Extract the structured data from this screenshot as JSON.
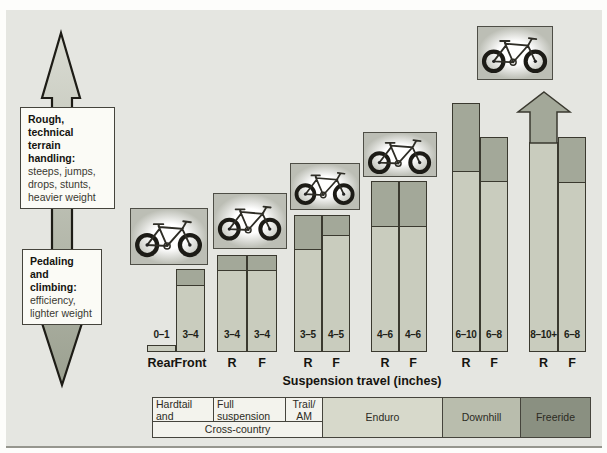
{
  "colors": {
    "panel_bg": "#e5e6e1",
    "bar_light": "#c9ccbe",
    "bar_dark": "#a3a899",
    "bar_border": "#3a392f",
    "arrow_gradient_top": "#dadcd3",
    "arrow_gradient_bottom": "#9ba090",
    "table_light": "#f3f3ed",
    "table_enduro": "#d7d9cb",
    "table_downhill": "#b9bdad",
    "table_freeride": "#8a9081"
  },
  "left_guide": {
    "top_box": {
      "title_lines": [
        "Rough, technical",
        "terrain handling:"
      ],
      "lines": [
        "steeps, jumps,",
        "drops, stunts,",
        "heavier weight"
      ]
    },
    "bottom_box": {
      "title_lines": [
        "Pedaling and",
        "climbing:"
      ],
      "lines": [
        "efficiency,",
        "lighter weight"
      ]
    }
  },
  "chart_data": {
    "type": "bar",
    "xlabel": "Suspension travel (inches)",
    "baseline_y": 352,
    "legend": "paired bars per bike class: R = rear travel, F = front travel; dark cap = travel range, open arrow = 10+ inches",
    "groups": [
      {
        "category": "Hardtail and softtail",
        "bike": {
          "icon": "hardtail-mountain-bike",
          "x": 130,
          "y": 208,
          "w": 78,
          "h": 57
        },
        "bars": [
          {
            "axis_label": "Rear",
            "travel": "0–1",
            "min": 0,
            "max": 1,
            "x": 147,
            "w": 29,
            "top": 345,
            "cap_bottom": 345
          },
          {
            "axis_label": "Front",
            "travel": "3–4",
            "min": 3,
            "max": 4,
            "x": 176,
            "w": 29,
            "top": 269,
            "cap_bottom": 285
          }
        ]
      },
      {
        "category": "Full suspension race",
        "bike": {
          "icon": "full-suspension-race-bike",
          "x": 213,
          "y": 193,
          "w": 74,
          "h": 56
        },
        "bars": [
          {
            "axis_label": "R",
            "travel": "3–4",
            "min": 3,
            "max": 4,
            "x": 217,
            "w": 30,
            "top": 255,
            "cap_bottom": 270
          },
          {
            "axis_label": "F",
            "travel": "3–4",
            "min": 3,
            "max": 4,
            "x": 247,
            "w": 30,
            "top": 255,
            "cap_bottom": 270
          }
        ]
      },
      {
        "category": "Trail/AM",
        "bike": {
          "icon": "trail-am-bike",
          "x": 290,
          "y": 163,
          "w": 70,
          "h": 47
        },
        "bars": [
          {
            "axis_label": "R",
            "travel": "3–5",
            "min": 3,
            "max": 5,
            "x": 294,
            "w": 28,
            "top": 215,
            "cap_bottom": 249
          },
          {
            "axis_label": "F",
            "travel": "4–5",
            "min": 4,
            "max": 5,
            "x": 322,
            "w": 28,
            "top": 215,
            "cap_bottom": 235
          }
        ]
      },
      {
        "category": "Enduro",
        "bike": {
          "icon": "enduro-bike",
          "x": 363,
          "y": 132,
          "w": 74,
          "h": 45
        },
        "bars": [
          {
            "axis_label": "R",
            "travel": "4–6",
            "min": 4,
            "max": 6,
            "x": 371,
            "w": 28,
            "top": 181,
            "cap_bottom": 226
          },
          {
            "axis_label": "F",
            "travel": "4–6",
            "min": 4,
            "max": 6,
            "x": 399,
            "w": 28,
            "top": 181,
            "cap_bottom": 226
          }
        ]
      },
      {
        "category": "Downhill",
        "bars": [
          {
            "axis_label": "R",
            "travel": "6–10",
            "min": 6,
            "max": 10,
            "x": 452,
            "w": 28,
            "top": 103,
            "cap_bottom": 171
          },
          {
            "axis_label": "F",
            "travel": "6–8",
            "min": 6,
            "max": 8,
            "x": 480,
            "w": 28,
            "top": 137,
            "cap_bottom": 181
          }
        ]
      },
      {
        "category": "Freeride",
        "bike": {
          "icon": "freeride-bike",
          "x": 477,
          "y": 26,
          "w": 76,
          "h": 54
        },
        "bars": [
          {
            "axis_label": "R",
            "travel": "8–10+",
            "min": 8,
            "max": 10,
            "open_ended": true,
            "x": 529,
            "w": 29,
            "top": 142,
            "cap_bottom": 142,
            "arrow": {
              "tip_x": 544,
              "tip_y": 92,
              "head_y": 112,
              "head_x0": 518,
              "head_x1": 570
            }
          },
          {
            "axis_label": "F",
            "travel": "6–8",
            "min": 6,
            "max": 8,
            "x": 558,
            "w": 28,
            "top": 137,
            "cap_bottom": 182
          }
        ]
      }
    ]
  },
  "table": {
    "cells": [
      {
        "lines": [
          "Hardtail and",
          "softtail"
        ],
        "x0": 152,
        "x1": 213,
        "y0": 397,
        "y1": 421,
        "bg": "table_light",
        "align": "left",
        "valign": "top"
      },
      {
        "lines": [
          "Full suspension",
          "race"
        ],
        "x0": 213,
        "x1": 285,
        "y0": 397,
        "y1": 421,
        "bg": "table_light",
        "align": "left",
        "valign": "top"
      },
      {
        "lines": [
          "Trail/",
          "AM"
        ],
        "x0": 285,
        "x1": 322,
        "y0": 397,
        "y1": 421,
        "bg": "table_light",
        "align": "center",
        "valign": "top"
      },
      {
        "lines": [
          "Cross-country"
        ],
        "x0": 152,
        "x1": 322,
        "y0": 421,
        "y1": 437,
        "bg": "table_light",
        "align": "center",
        "valign": "middle"
      },
      {
        "lines": [
          "Enduro"
        ],
        "x0": 322,
        "x1": 442,
        "y0": 397,
        "y1": 437,
        "bg": "table_enduro",
        "align": "center",
        "valign": "middle"
      },
      {
        "lines": [
          "Downhill"
        ],
        "x0": 442,
        "x1": 520,
        "y0": 397,
        "y1": 437,
        "bg": "table_downhill",
        "align": "center",
        "valign": "middle"
      },
      {
        "lines": [
          "Freeride"
        ],
        "x0": 520,
        "x1": 590,
        "y0": 397,
        "y1": 437,
        "bg": "table_freeride",
        "align": "center",
        "valign": "middle"
      }
    ]
  }
}
